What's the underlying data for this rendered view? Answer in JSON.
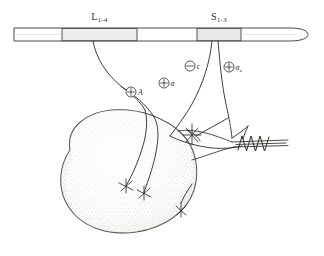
{
  "figure": {
    "background_color": "#ffffff",
    "ink_color": "#35352f",
    "segment_fill_color": "#eeeeee",
    "muscle_fill_color": "#f7f7f5"
  },
  "spinal_cord": {
    "name": "spinal-cord",
    "segments": [
      {
        "id": "L1-4",
        "label_main": "L",
        "label_sub": "1-4",
        "fill": "#eeeeee"
      },
      {
        "id": "S1-3",
        "label_main": "S",
        "label_sub": "1-3",
        "fill": "#e9e9e9"
      }
    ]
  },
  "signs": [
    {
      "id": "sign-plus-A",
      "polarity": "+",
      "glyph": "plus",
      "label_main": "A",
      "label_sub": ""
    },
    {
      "id": "sign-plus-alpha-1",
      "polarity": "+",
      "glyph": "plus",
      "label_main": "α",
      "label_sub": ""
    },
    {
      "id": "sign-minus-c",
      "polarity": "−",
      "glyph": "minus",
      "label_main": "c",
      "label_sub": ""
    },
    {
      "id": "sign-plus-alpha-2",
      "polarity": "+",
      "glyph": "plus",
      "label_main": "α",
      "label_sub": "a"
    }
  ],
  "muscle": {
    "name": "muscle-belly",
    "fill": "#f7f7f5",
    "stipple": true
  },
  "tendon": {
    "name": "tendon",
    "receptor": "golgi-tendon-organ-spring"
  },
  "spindle": {
    "name": "muscle-spindle"
  },
  "endplates": [
    {
      "id": "endplate-1"
    },
    {
      "id": "endplate-2"
    },
    {
      "id": "endplate-3"
    }
  ]
}
